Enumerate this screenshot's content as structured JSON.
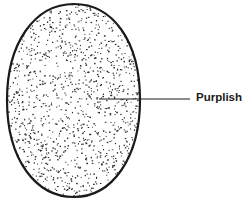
{
  "diagram": {
    "shape": "stippled-oval",
    "labels": [
      {
        "text": "Purplish"
      }
    ],
    "colors": {
      "outline": "#1a1a1a",
      "stipple": "#2a2a2a",
      "background": "#ffffff"
    }
  }
}
